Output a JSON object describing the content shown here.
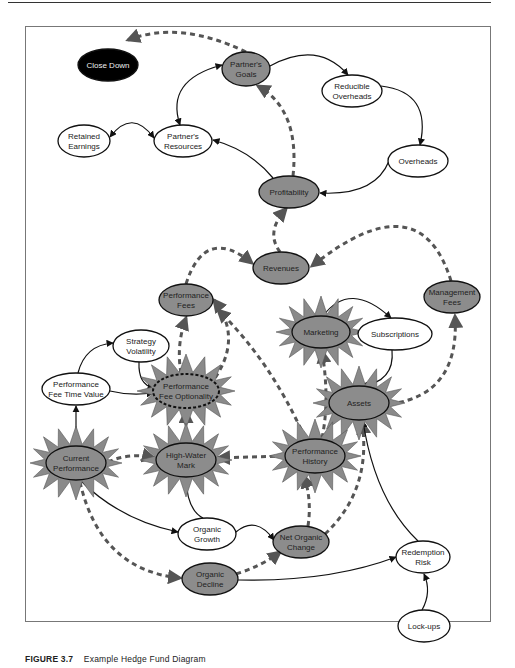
{
  "caption": {
    "figure": "FIGURE 3.7",
    "title": "Example Hedge Fund Diagram"
  },
  "colors": {
    "shaded_fill": "#8c8c8c",
    "star_fill": "#8a8a8a",
    "white_fill": "#ffffff",
    "black_fill": "#000000",
    "dashed_edge": "#555555",
    "solid_edge": "#111111"
  },
  "nodes": {
    "close_down": {
      "lines": [
        "Close Down"
      ],
      "style": "black",
      "cx": 108,
      "cy": 65,
      "rx": 30,
      "ry": 16
    },
    "partners_goals": {
      "lines": [
        "Partner's",
        "Goals"
      ],
      "style": "shaded",
      "cx": 246,
      "cy": 69,
      "rx": 24,
      "ry": 17
    },
    "reducible_overheads": {
      "lines": [
        "Reducible",
        "Overheads"
      ],
      "style": "white",
      "cx": 352,
      "cy": 91,
      "rx": 30,
      "ry": 16
    },
    "retained_earnings": {
      "lines": [
        "Retained",
        "Earnings"
      ],
      "style": "white",
      "cx": 84,
      "cy": 141,
      "rx": 26,
      "ry": 16
    },
    "partners_resources": {
      "lines": [
        "Partner's",
        "Resources"
      ],
      "style": "white",
      "cx": 183,
      "cy": 141,
      "rx": 29,
      "ry": 16
    },
    "overheads": {
      "lines": [
        "Overheads"
      ],
      "style": "white",
      "cx": 418,
      "cy": 161,
      "rx": 30,
      "ry": 16
    },
    "profitability": {
      "lines": [
        "Profitability"
      ],
      "style": "shaded",
      "cx": 289,
      "cy": 192,
      "rx": 30,
      "ry": 16
    },
    "revenues": {
      "lines": [
        "Revenues"
      ],
      "style": "shaded",
      "cx": 281,
      "cy": 268,
      "rx": 28,
      "ry": 16
    },
    "management_fees": {
      "lines": [
        "Management",
        "Fees"
      ],
      "style": "shaded",
      "cx": 452,
      "cy": 297,
      "rx": 28,
      "ry": 16
    },
    "performance_fees": {
      "lines": [
        "Performance",
        "Fees"
      ],
      "style": "shaded",
      "cx": 186,
      "cy": 300,
      "rx": 27,
      "ry": 16
    },
    "marketing": {
      "lines": [
        "Marketing"
      ],
      "style": "star",
      "cx": 321,
      "cy": 332,
      "rx": 29,
      "ry": 16
    },
    "subscriptions": {
      "lines": [
        "Subscriptions"
      ],
      "style": "white",
      "cx": 395,
      "cy": 334,
      "rx": 37,
      "ry": 16
    },
    "strategy_volatility": {
      "lines": [
        "Strategy",
        "Volatility"
      ],
      "style": "white",
      "cx": 141,
      "cy": 346,
      "rx": 28,
      "ry": 16
    },
    "performance_fee_time_value": {
      "lines": [
        "Performance",
        "Fee Time Value"
      ],
      "style": "white",
      "cx": 76,
      "cy": 389,
      "rx": 34,
      "ry": 16
    },
    "performance_fee_optionality": {
      "lines": [
        "Performance",
        "Fee Optionality"
      ],
      "style": "star-dotted",
      "cx": 186,
      "cy": 391,
      "rx": 33,
      "ry": 17
    },
    "assets": {
      "lines": [
        "Assets"
      ],
      "style": "star",
      "cx": 359,
      "cy": 403,
      "rx": 30,
      "ry": 17
    },
    "current_performance": {
      "lines": [
        "Current",
        "Performance"
      ],
      "style": "star",
      "cx": 76,
      "cy": 463,
      "rx": 30,
      "ry": 17
    },
    "high_water_mark": {
      "lines": [
        "High-Water",
        "Mark"
      ],
      "style": "star",
      "cx": 186,
      "cy": 460,
      "rx": 30,
      "ry": 17
    },
    "performance_history": {
      "lines": [
        "Performance",
        "History"
      ],
      "style": "star",
      "cx": 315,
      "cy": 456,
      "rx": 30,
      "ry": 17
    },
    "organic_growth": {
      "lines": [
        "Organic",
        "Growth"
      ],
      "style": "white",
      "cx": 207,
      "cy": 534,
      "rx": 29,
      "ry": 16
    },
    "net_organic_change": {
      "lines": [
        "Net Organic",
        "Change"
      ],
      "style": "shaded",
      "cx": 301,
      "cy": 542,
      "rx": 28,
      "ry": 16
    },
    "organic_decline": {
      "lines": [
        "Organic",
        "Decline"
      ],
      "style": "shaded",
      "cx": 210,
      "cy": 579,
      "rx": 28,
      "ry": 16
    },
    "redemption_risk": {
      "lines": [
        "Redemption",
        "Risk"
      ],
      "style": "white",
      "cx": 423,
      "cy": 557,
      "rx": 27,
      "ry": 16
    },
    "lock_ups": {
      "lines": [
        "Lock-ups"
      ],
      "style": "white",
      "cx": 424,
      "cy": 626,
      "rx": 26,
      "ry": 16
    }
  },
  "edges": [
    {
      "from": "partners_goals",
      "to": "close_down",
      "type": "dashed"
    },
    {
      "from": "partners_goals",
      "to": "reducible_overheads",
      "type": "solid"
    },
    {
      "from": "reducible_overheads",
      "to": "overheads",
      "type": "solid"
    },
    {
      "from": "overheads",
      "to": "profitability",
      "type": "solid"
    },
    {
      "from": "profitability",
      "to": "partners_goals",
      "type": "dashed"
    },
    {
      "from": "profitability",
      "to": "partners_resources",
      "type": "solid"
    },
    {
      "from": "partners_resources",
      "to": "partners_goals",
      "type": "solid-bidirectional"
    },
    {
      "from": "partners_resources",
      "to": "retained_earnings",
      "type": "solid-bidirectional"
    },
    {
      "from": "revenues",
      "to": "profitability",
      "type": "dashed"
    },
    {
      "from": "performance_fees",
      "to": "revenues",
      "type": "dashed"
    },
    {
      "from": "management_fees",
      "to": "revenues",
      "type": "dashed"
    },
    {
      "from": "assets",
      "to": "management_fees",
      "type": "dashed"
    },
    {
      "from": "marketing",
      "to": "subscriptions",
      "type": "solid"
    },
    {
      "from": "subscriptions",
      "to": "assets",
      "type": "solid"
    },
    {
      "from": "performance_fee_optionality",
      "to": "performance_fees",
      "type": "dashed"
    },
    {
      "from": "performance_history",
      "to": "performance_fees",
      "type": "dashed"
    },
    {
      "from": "performance_history",
      "to": "marketing",
      "type": "dashed"
    },
    {
      "from": "performance_fee_time_value",
      "to": "strategy_volatility",
      "type": "solid"
    },
    {
      "from": "strategy_volatility",
      "to": "performance_fee_optionality",
      "type": "solid"
    },
    {
      "from": "performance_fee_time_value",
      "to": "performance_fee_optionality",
      "type": "solid"
    },
    {
      "from": "high_water_mark",
      "to": "performance_fee_optionality",
      "type": "dashed"
    },
    {
      "from": "current_performance",
      "to": "performance_fee_time_value",
      "type": "solid"
    },
    {
      "from": "current_performance",
      "to": "high_water_mark",
      "type": "dashed"
    },
    {
      "from": "performance_history",
      "to": "high_water_mark",
      "type": "dashed"
    },
    {
      "from": "organic_growth",
      "to": "high_water_mark",
      "type": "solid"
    },
    {
      "from": "current_performance",
      "to": "organic_growth",
      "type": "solid"
    },
    {
      "from": "organic_growth",
      "to": "net_organic_change",
      "type": "solid"
    },
    {
      "from": "current_performance",
      "to": "organic_decline",
      "type": "dashed"
    },
    {
      "from": "organic_decline",
      "to": "net_organic_change",
      "type": "dashed"
    },
    {
      "from": "net_organic_change",
      "to": "performance_history",
      "type": "dashed"
    },
    {
      "from": "net_organic_change",
      "to": "assets",
      "type": "dashed"
    },
    {
      "from": "organic_decline",
      "to": "redemption_risk",
      "type": "solid"
    },
    {
      "from": "redemption_risk",
      "to": "assets",
      "type": "solid"
    },
    {
      "from": "lock_ups",
      "to": "redemption_risk",
      "type": "solid"
    }
  ]
}
